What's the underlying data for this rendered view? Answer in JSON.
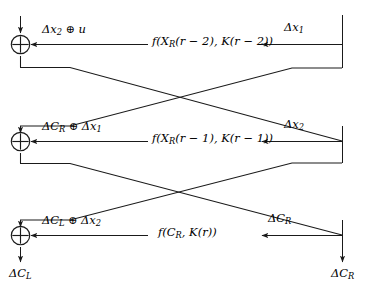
{
  "diagram": {
    "type": "block-cipher-differential-diagram",
    "background_color": "#ffffff",
    "line_color": "#1a1a1a",
    "text_color": "#000000",
    "rows": [
      {
        "id": "round-r-minus-2",
        "xor_label": "xor-node-top",
        "left_arrow_label": "Δx₂ ⊕ u",
        "function_label": "f(XR(r − 2), K(r − 2))",
        "function_parts": {
          "f": "f",
          "open": "(",
          "arg1_base": "X",
          "arg1_sub": "R",
          "arg1_idx": "(r − 2)",
          "comma": ", ",
          "arg2_base": "K",
          "arg2_idx": "(r − 2)",
          "close": ")"
        },
        "right_arrow_label": "Δx₁",
        "right_arrow_parts": {
          "base": "Δx",
          "sub": "1"
        }
      },
      {
        "id": "round-r-minus-1",
        "xor_label": "xor-node-middle",
        "left_arrow_label": "ΔCR ⊕ Δx₁",
        "function_label": "f(XR(r − 1), K(r − 1))",
        "function_parts": {
          "f": "f",
          "open": "(",
          "arg1_base": "X",
          "arg1_sub": "R",
          "arg1_idx": "(r − 1)",
          "comma": ", ",
          "arg2_base": "K",
          "arg2_idx": "(r − 1)",
          "close": ")"
        },
        "right_arrow_label": "Δx₂",
        "right_arrow_parts": {
          "base": "Δx",
          "sub": "2"
        }
      },
      {
        "id": "round-r",
        "xor_label": "xor-node-bottom",
        "left_arrow_label": "ΔCL ⊕ Δx₂",
        "function_label": "f(CR, K(r))",
        "function_parts": {
          "f": "f",
          "open": "(",
          "arg1_base": "C",
          "arg1_sub": "R",
          "arg1_idx": "",
          "comma": ", ",
          "arg2_base": "K",
          "arg2_idx": "(r)",
          "close": ")"
        },
        "right_arrow_label": "ΔCR",
        "right_arrow_parts": {
          "base": "ΔC",
          "sub": "R"
        }
      }
    ],
    "outputs": {
      "left": {
        "base": "ΔC",
        "sub": "L",
        "full": "ΔCL"
      },
      "right": {
        "base": "ΔC",
        "sub": "R",
        "full": "ΔCR"
      }
    },
    "xor_symbol": "⊕",
    "delta_symbol": "Δ"
  }
}
